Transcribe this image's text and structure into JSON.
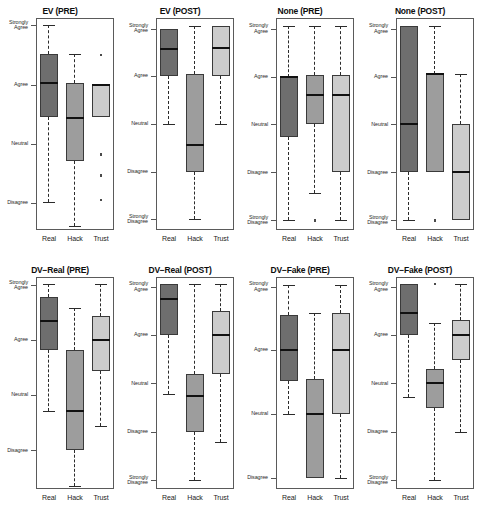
{
  "figure": {
    "title": "",
    "rows": 2,
    "cols": 4,
    "groups": [
      "Real",
      "Hack",
      "Trust"
    ],
    "group_colors": [
      "#6e6e6e",
      "#9d9d9d",
      "#cccccc"
    ]
  },
  "chart_data": {
    "type": "box",
    "title": "",
    "xlabel": "",
    "ylabel": "",
    "grid": false,
    "legend": "none",
    "scale_labels": [
      "Strongly Disagree",
      "Disagree",
      "Neutral",
      "Agree",
      "Strongly Agree"
    ],
    "scale_values": [
      1,
      2,
      3,
      4,
      5
    ],
    "categories": [
      "Real",
      "Hack",
      "Trust"
    ],
    "series_colors": {
      "Real": "#6e6e6e",
      "Hack": "#9d9d9d",
      "Trust": "#cccccc"
    },
    "panels": [
      {
        "title": "EV (PRE)",
        "ticks": [
          {
            "label": "Strongly\nAgree",
            "value": 5.0
          },
          {
            "label": "Agree",
            "value": 4.0
          },
          {
            "label": "Neutral",
            "value": 3.0
          },
          {
            "label": "Disagree",
            "value": 2.0
          }
        ],
        "ylim": [
          1.55,
          5.12
        ],
        "boxes": [
          {
            "group": "Real",
            "q1": 3.45,
            "median": 4.02,
            "q3": 4.52,
            "lower": 2.02,
            "upper": 5.0,
            "outliers": []
          },
          {
            "group": "Hack",
            "q1": 2.72,
            "median": 3.43,
            "q3": 4.03,
            "lower": 1.62,
            "upper": 4.52,
            "outliers": []
          },
          {
            "group": "Trust",
            "q1": 3.45,
            "median": 4.0,
            "q3": 4.0,
            "lower": 3.45,
            "upper": 4.0,
            "outliers": [
              4.5,
              2.82,
              2.47,
              2.05
            ]
          }
        ]
      },
      {
        "title": "EV (POST)",
        "ticks": [
          {
            "label": "Strongly\nAgree",
            "value": 5.0
          },
          {
            "label": "Agree",
            "value": 4.0
          },
          {
            "label": "Neutral",
            "value": 3.0
          },
          {
            "label": "Disagree",
            "value": 2.0
          },
          {
            "label": "Strongly\nDisagree",
            "value": 1.0
          }
        ],
        "ylim": [
          0.78,
          5.22
        ],
        "boxes": [
          {
            "group": "Real",
            "q1": 4.0,
            "median": 4.58,
            "q3": 5.0,
            "lower": 3.0,
            "upper": 5.0,
            "outliers": []
          },
          {
            "group": "Hack",
            "q1": 2.0,
            "median": 2.55,
            "q3": 4.04,
            "lower": 1.0,
            "upper": 5.05,
            "outliers": []
          },
          {
            "group": "Trust",
            "q1": 4.0,
            "median": 4.6,
            "q3": 5.05,
            "lower": 3.0,
            "upper": 5.05,
            "outliers": []
          }
        ]
      },
      {
        "title": "None (PRE)",
        "ticks": [
          {
            "label": "Strongly\nAgree",
            "value": 5.0
          },
          {
            "label": "Agree",
            "value": 4.0
          },
          {
            "label": "Neutral",
            "value": 3.0
          },
          {
            "label": "Disagree",
            "value": 2.0
          },
          {
            "label": "Strongly\nDisagree",
            "value": 1.0
          }
        ],
        "ylim": [
          0.8,
          5.22
        ],
        "boxes": [
          {
            "group": "Real",
            "q1": 2.73,
            "median": 4.0,
            "q3": 4.0,
            "lower": 1.0,
            "upper": 5.05,
            "outliers": []
          },
          {
            "group": "Hack",
            "q1": 3.0,
            "median": 3.62,
            "q3": 4.03,
            "lower": 1.58,
            "upper": 5.05,
            "outliers": [
              1.0
            ]
          },
          {
            "group": "Trust",
            "q1": 2.0,
            "median": 3.62,
            "q3": 4.04,
            "lower": 1.0,
            "upper": 5.05,
            "outliers": []
          }
        ]
      },
      {
        "title": "None (POST)",
        "ticks": [
          {
            "label": "Strongly\nAgree",
            "value": 5.0
          },
          {
            "label": "Agree",
            "value": 4.0
          },
          {
            "label": "Neutral",
            "value": 3.0
          },
          {
            "label": "Disagree",
            "value": 2.0
          },
          {
            "label": "Strongly\nDisagree",
            "value": 1.0
          }
        ],
        "ylim": [
          0.8,
          5.22
        ],
        "boxes": [
          {
            "group": "Real",
            "q1": 2.0,
            "median": 3.0,
            "q3": 5.05,
            "lower": 1.0,
            "upper": 5.05,
            "outliers": []
          },
          {
            "group": "Hack",
            "q1": 2.0,
            "median": 4.05,
            "q3": 4.05,
            "lower": 2.0,
            "upper": 5.05,
            "outliers": [
              1.0
            ]
          },
          {
            "group": "Trust",
            "q1": 1.0,
            "median": 2.0,
            "q3": 3.0,
            "lower": 1.0,
            "upper": 4.05,
            "outliers": []
          }
        ]
      },
      {
        "title": "DV−Real (PRE)",
        "ticks": [
          {
            "label": "Strongly\nAgree",
            "value": 5.0
          },
          {
            "label": "Agree",
            "value": 4.0
          },
          {
            "label": "Neutral",
            "value": 3.0
          },
          {
            "label": "Disagree",
            "value": 2.0
          }
        ],
        "ylim": [
          1.3,
          5.15
        ],
        "boxes": [
          {
            "group": "Real",
            "q1": 3.82,
            "median": 4.35,
            "q3": 4.78,
            "lower": 2.72,
            "upper": 5.02,
            "outliers": []
          },
          {
            "group": "Hack",
            "q1": 2.0,
            "median": 2.72,
            "q3": 3.82,
            "lower": 1.35,
            "upper": 4.58,
            "outliers": []
          },
          {
            "group": "Trust",
            "q1": 3.45,
            "median": 4.0,
            "q3": 4.45,
            "lower": 2.45,
            "upper": 5.02,
            "outliers": []
          }
        ]
      },
      {
        "title": "DV−Real (POST)",
        "ticks": [
          {
            "label": "Strongly\nAgree",
            "value": 5.0
          },
          {
            "label": "Agree",
            "value": 4.0
          },
          {
            "label": "Neutral",
            "value": 3.0
          },
          {
            "label": "Disagree",
            "value": 2.0
          },
          {
            "label": "Strongly\nDisagree",
            "value": 1.0
          }
        ],
        "ylim": [
          0.82,
          5.2
        ],
        "boxes": [
          {
            "group": "Real",
            "q1": 4.0,
            "median": 4.75,
            "q3": 5.05,
            "lower": 2.78,
            "upper": 5.05,
            "outliers": []
          },
          {
            "group": "Hack",
            "q1": 2.0,
            "median": 2.75,
            "q3": 3.2,
            "lower": 1.0,
            "upper": 5.05,
            "outliers": []
          },
          {
            "group": "Trust",
            "q1": 3.2,
            "median": 4.0,
            "q3": 4.5,
            "lower": 1.8,
            "upper": 5.05,
            "outliers": []
          }
        ]
      },
      {
        "title": "DV−Fake (PRE)",
        "ticks": [
          {
            "label": "Strongly\nAgree",
            "value": 5.0
          },
          {
            "label": "Agree",
            "value": 4.0
          },
          {
            "label": "Neutral",
            "value": 3.0
          },
          {
            "label": "Disagree",
            "value": 2.0
          }
        ],
        "ylim": [
          1.82,
          5.15
        ],
        "boxes": [
          {
            "group": "Real",
            "q1": 3.52,
            "median": 4.0,
            "q3": 4.55,
            "lower": 3.0,
            "upper": 5.02,
            "outliers": []
          },
          {
            "group": "Hack",
            "q1": 2.0,
            "median": 3.0,
            "q3": 3.55,
            "lower": 2.0,
            "upper": 4.58,
            "outliers": []
          },
          {
            "group": "Trust",
            "q1": 3.0,
            "median": 4.0,
            "q3": 4.58,
            "lower": 2.0,
            "upper": 5.02,
            "outliers": []
          }
        ]
      },
      {
        "title": "DV−Fake (POST)",
        "ticks": [
          {
            "label": "Strongly\nAgree",
            "value": 5.0
          },
          {
            "label": "Agree",
            "value": 4.0
          },
          {
            "label": "Neutral",
            "value": 3.0
          },
          {
            "label": "Disagree",
            "value": 2.0
          },
          {
            "label": "Strongly\nDisagree",
            "value": 1.0
          }
        ],
        "ylim": [
          0.82,
          5.2
        ],
        "boxes": [
          {
            "group": "Real",
            "q1": 4.0,
            "median": 4.45,
            "q3": 5.05,
            "lower": 2.72,
            "upper": 5.05,
            "outliers": []
          },
          {
            "group": "Hack",
            "q1": 2.5,
            "median": 3.0,
            "q3": 3.3,
            "lower": 1.0,
            "upper": 4.25,
            "outliers": [
              5.05
            ]
          },
          {
            "group": "Trust",
            "q1": 3.48,
            "median": 4.0,
            "q3": 4.32,
            "lower": 2.0,
            "upper": 5.05,
            "outliers": []
          }
        ]
      }
    ]
  }
}
